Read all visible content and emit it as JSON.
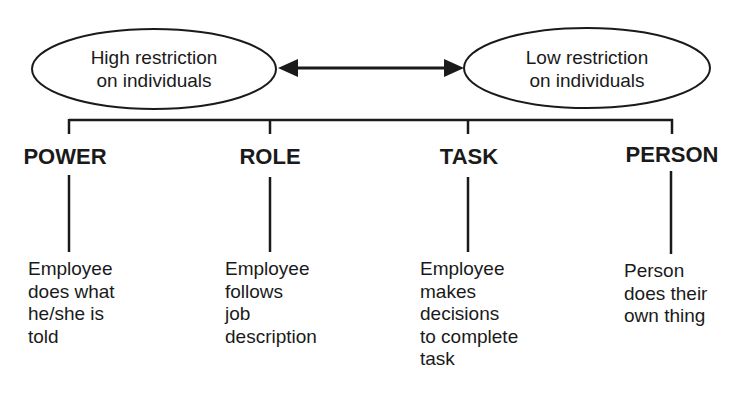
{
  "spectrum": {
    "left": {
      "line1": "High restriction",
      "line2": "on individuals"
    },
    "right": {
      "line1": "Low restriction",
      "line2": "on individuals"
    }
  },
  "cultures": [
    {
      "label": "POWER",
      "desc": [
        "Employee",
        "does what",
        "he/she is",
        "told"
      ]
    },
    {
      "label": "ROLE",
      "desc": [
        "Employee",
        "follows",
        "job",
        "description"
      ]
    },
    {
      "label": "TASK",
      "desc": [
        "Employee",
        "makes",
        "decisions",
        "to complete",
        "task"
      ]
    },
    {
      "label": "PERSON",
      "desc": [
        "Person",
        "does their",
        "own thing"
      ]
    }
  ],
  "colors": {
    "ink": "#1a1a1a",
    "background": "#ffffff"
  }
}
